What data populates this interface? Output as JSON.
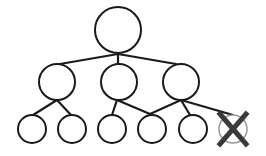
{
  "diagram": {
    "type": "tree",
    "colors": {
      "background": "#ffffff",
      "stroke": "#1a1a1a",
      "removed_circle": "#9a9a9a",
      "removed_mark": "#3a3a3a"
    },
    "nodes": [
      {
        "id": "root",
        "level": 0,
        "cx": 118,
        "cy": 30,
        "r": 23,
        "removed": false
      },
      {
        "id": "mid-left",
        "level": 1,
        "cx": 57,
        "cy": 82,
        "r": 18,
        "removed": false
      },
      {
        "id": "mid-center",
        "level": 1,
        "cx": 119,
        "cy": 82,
        "r": 18,
        "removed": false
      },
      {
        "id": "mid-right",
        "level": 1,
        "cx": 181,
        "cy": 82,
        "r": 18,
        "removed": false
      },
      {
        "id": "leaf-1",
        "level": 2,
        "cx": 32,
        "cy": 129,
        "r": 14,
        "removed": false
      },
      {
        "id": "leaf-2",
        "level": 2,
        "cx": 72,
        "cy": 129,
        "r": 14,
        "removed": false
      },
      {
        "id": "leaf-3",
        "level": 2,
        "cx": 112,
        "cy": 129,
        "r": 14,
        "removed": false
      },
      {
        "id": "leaf-4",
        "level": 2,
        "cx": 152,
        "cy": 129,
        "r": 14,
        "removed": false
      },
      {
        "id": "leaf-5",
        "level": 2,
        "cx": 193,
        "cy": 129,
        "r": 14,
        "removed": false
      },
      {
        "id": "leaf-6",
        "level": 2,
        "cx": 233,
        "cy": 129,
        "r": 14,
        "removed": true
      }
    ],
    "edges": [
      {
        "from": "root",
        "to": "mid-left",
        "x1": 118,
        "y1": 54,
        "x2": 60,
        "y2": 64
      },
      {
        "from": "root",
        "to": "mid-center",
        "x1": 118,
        "y1": 54,
        "x2": 118,
        "y2": 64
      },
      {
        "from": "root",
        "to": "mid-right",
        "x1": 118,
        "y1": 54,
        "x2": 176,
        "y2": 64
      },
      {
        "from": "mid-left",
        "to": "leaf-1",
        "x1": 57,
        "y1": 100,
        "x2": 33,
        "y2": 115
      },
      {
        "from": "mid-left",
        "to": "leaf-2",
        "x1": 57,
        "y1": 100,
        "x2": 71,
        "y2": 115
      },
      {
        "from": "mid-center",
        "to": "leaf-3",
        "x1": 117,
        "y1": 100,
        "x2": 112,
        "y2": 115
      },
      {
        "from": "mid-center",
        "to": "leaf-4",
        "x1": 117,
        "y1": 100,
        "x2": 150,
        "y2": 114
      },
      {
        "from": "mid-right",
        "to": "leaf-4",
        "x1": 181,
        "y1": 100,
        "x2": 150,
        "y2": 114
      },
      {
        "from": "mid-right",
        "to": "leaf-5",
        "x1": 181,
        "y1": 100,
        "x2": 190,
        "y2": 115
      },
      {
        "from": "mid-right",
        "to": "leaf-6",
        "x1": 181,
        "y1": 100,
        "x2": 233,
        "y2": 115
      }
    ],
    "removed_marker": {
      "node": "leaf-6",
      "x1": 220,
      "y1": 114,
      "x2": 246,
      "y2": 144,
      "x3": 246,
      "y3": 114,
      "x4": 220,
      "y4": 144,
      "stroke_width": 5
    }
  }
}
